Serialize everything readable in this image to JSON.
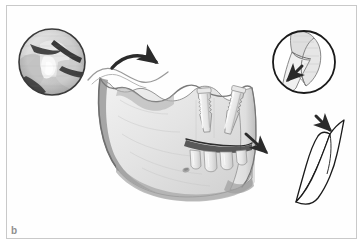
{
  "figure": {
    "label": "b",
    "panel_background": "#ffffff",
    "frame_color": "#c9c9c9",
    "label_color": "#8f8f8f"
  },
  "illustration": {
    "subject": "mandible-bone-graft-procedure",
    "bone_fill": "#e2e2e2",
    "bone_shadow": "#a8a8a8",
    "bone_outline": "#6e6e6e",
    "tooth_fill": "#ededed",
    "arrow_color": "#2b2b2b",
    "outline_color": "#1a1a1a"
  },
  "elements": {
    "main_mandible": {
      "name": "mandible-bone",
      "description": "Lateral view of human mandible with ramus, body and alveolar ridge"
    },
    "left_inset": {
      "name": "surgical-photo-inset",
      "description": "Circular grayscale intraoperative close-up of graft site"
    },
    "right_inset": {
      "name": "graft-diagram-inset",
      "description": "Circular line drawing of bone segment with placement arrow"
    },
    "graft_outline": {
      "name": "harvested-bone-graft",
      "description": "Outline drawing of harvested bone graft wedge"
    },
    "implants": {
      "name": "dental-implants",
      "description": "Two upright implant fixtures above the alveolar ridge"
    },
    "lower_teeth": {
      "name": "posterior-teeth",
      "description": "Posterior molars along the occlusal plane"
    }
  },
  "arrows": [
    {
      "name": "arrow-graft-to-ridge",
      "direction": "down-right",
      "position": "top-center"
    },
    {
      "name": "arrow-implant-site",
      "direction": "down-right",
      "position": "center-right"
    },
    {
      "name": "arrow-graft-harvest",
      "direction": "down-right",
      "position": "right"
    },
    {
      "name": "arrow-inset-detail",
      "direction": "down-left",
      "position": "right-inset"
    }
  ]
}
